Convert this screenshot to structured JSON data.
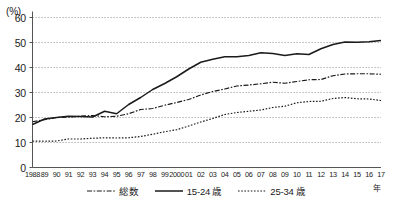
{
  "chart_data": {
    "type": "line",
    "title": "",
    "xlabel": "年",
    "ylabel": "(%)",
    "ylim": [
      0,
      60
    ],
    "ytick_values": [
      0,
      10,
      20,
      30,
      40,
      50,
      60
    ],
    "ytick_labels": [
      "0",
      "10",
      "20",
      "30",
      "40",
      "50",
      "60"
    ],
    "grid": true,
    "legend_position": "bottom-center",
    "categories": [
      "1988",
      "89",
      "90",
      "91",
      "92",
      "93",
      "94",
      "95",
      "96",
      "97",
      "98",
      "99",
      "2000",
      "01",
      "02",
      "03",
      "04",
      "05",
      "06",
      "07",
      "08",
      "09",
      "10",
      "11",
      "12",
      "13",
      "14",
      "15",
      "16",
      "17"
    ],
    "series": [
      {
        "name": "総数",
        "style": "dash-dot",
        "color": "#1a1a1a",
        "values": [
          18.3,
          19.1,
          20.0,
          20.2,
          20.5,
          20.8,
          20.3,
          20.5,
          21.5,
          23.2,
          23.6,
          24.9,
          26.0,
          27.2,
          29.0,
          30.4,
          31.4,
          32.6,
          33.0,
          33.5,
          34.1,
          33.7,
          34.4,
          35.1,
          35.2,
          36.7,
          37.4,
          37.5,
          37.5,
          37.3
        ],
        "marker": "none"
      },
      {
        "name": "15-24 歳",
        "style": "solid",
        "color": "#1a1a1a",
        "values": [
          17.2,
          19.4,
          20.0,
          20.5,
          20.4,
          20.2,
          22.5,
          21.5,
          25.2,
          28.0,
          31.2,
          33.6,
          36.3,
          39.4,
          42.1,
          43.3,
          44.3,
          44.3,
          44.8,
          45.9,
          45.6,
          44.8,
          45.5,
          45.2,
          47.5,
          49.2,
          50.2,
          50.1,
          50.3,
          50.8
        ]
      },
      {
        "name": "25-34 歳",
        "style": "dotted",
        "color": "#1a1a1a",
        "values": [
          10.6,
          10.5,
          10.6,
          11.4,
          11.4,
          11.7,
          11.9,
          11.8,
          11.9,
          12.4,
          13.3,
          14.3,
          15.1,
          16.6,
          18.2,
          19.6,
          21.2,
          22.0,
          22.5,
          23.0,
          24.0,
          24.5,
          25.9,
          26.4,
          26.5,
          27.6,
          28.0,
          27.5,
          27.4,
          26.8
        ]
      }
    ]
  },
  "legend": {
    "items": [
      {
        "label": "総数",
        "style": "dash-dot"
      },
      {
        "label": "15-24 歳",
        "style": "solid"
      },
      {
        "label": "25-34 歳",
        "style": "dotted"
      }
    ]
  }
}
